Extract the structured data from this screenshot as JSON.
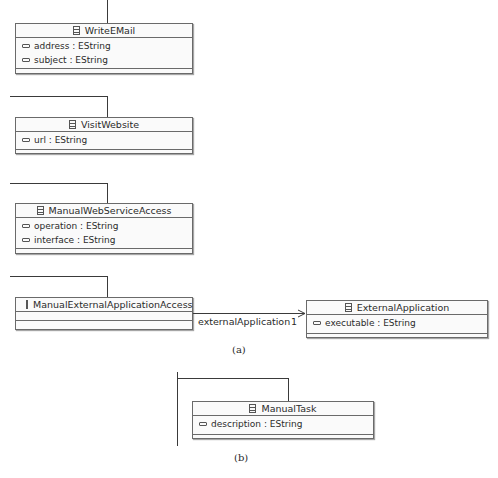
{
  "figure_a": {
    "caption": "(a)",
    "classes": [
      {
        "name": "WriteEMail",
        "attributes": [
          {
            "name": "address",
            "type": "EString"
          },
          {
            "name": "subject",
            "type": "EString"
          }
        ]
      },
      {
        "name": "VisitWebsite",
        "attributes": [
          {
            "name": "url",
            "type": "EString"
          }
        ]
      },
      {
        "name": "ManualWebServiceAccess",
        "attributes": [
          {
            "name": "operation",
            "type": "EString"
          },
          {
            "name": "interface",
            "type": "EString"
          }
        ]
      },
      {
        "name": "ManualExternalApplicationAccess",
        "attributes": []
      },
      {
        "name": "ExternalApplication",
        "attributes": [
          {
            "name": "executable",
            "type": "EString"
          }
        ]
      }
    ],
    "association": {
      "role": "externalApplication",
      "multiplicity": "1"
    }
  },
  "figure_b": {
    "caption": "(b)",
    "classes": [
      {
        "name": "ManualTask",
        "attributes": [
          {
            "name": "description",
            "type": "EString"
          }
        ]
      }
    ]
  },
  "attr_text": {
    "address": "address : EString",
    "subject": "subject : EString",
    "url": "url : EString",
    "operation": "operation : EString",
    "interface": "interface : EString",
    "executable": "executable : EString",
    "description": "description : EString"
  }
}
